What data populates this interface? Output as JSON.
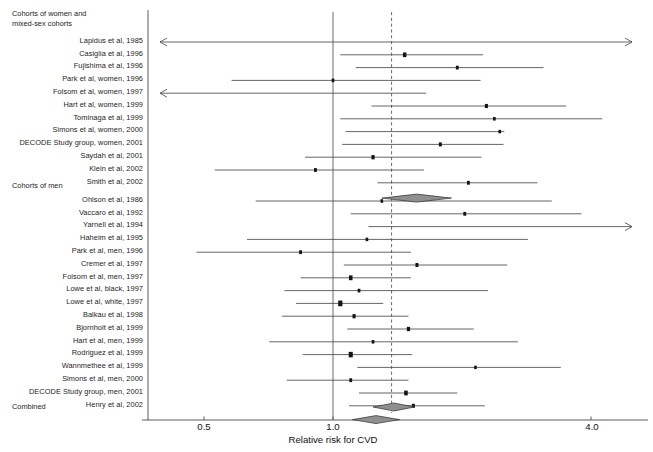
{
  "chart_data": {
    "type": "forest",
    "title": "",
    "xlabel": "Relative risk for CVD",
    "ylabel": "",
    "scale": "log",
    "xlim": [
      0.36,
      4.9
    ],
    "ticks": [
      {
        "value": 0.5,
        "label": "0.5"
      },
      {
        "value": 1.0,
        "label": "1.0"
      },
      {
        "value": 4.0,
        "label": "4.0"
      }
    ],
    "reference_line": {
      "value": 1.0,
      "style": "solid"
    },
    "pooled_line": {
      "value": 1.37,
      "style": "dashed"
    },
    "groups": [
      {
        "name": "Cohorts of women and mixed-sex cohorts",
        "heading_lines": [
          "Cohorts of women and",
          "mixed-sex cohorts"
        ],
        "studies": [
          {
            "label": "Lapidus et al, 1985",
            "rr": 1.37,
            "lo": 0.37,
            "hi": 4.9,
            "size": 0,
            "lo_clipped": true,
            "hi_clipped": true
          },
          {
            "label": "Casiglia et al, 1996",
            "rr": 1.47,
            "lo": 1.04,
            "hi": 2.24,
            "size": 3.3
          },
          {
            "label": "Fujishima et al, 1996",
            "rr": 1.95,
            "lo": 1.13,
            "hi": 3.1,
            "size": 1.9
          },
          {
            "label": "Park et al, women, 1996",
            "rr": 1.0,
            "lo": 0.58,
            "hi": 2.21,
            "size": 1.6
          },
          {
            "label": "Folsom et al, women, 1997",
            "rr": 1.37,
            "lo": 0.37,
            "hi": 1.65,
            "size": 0,
            "lo_clipped": true
          },
          {
            "label": "Hart et al, women, 1999",
            "rr": 2.28,
            "lo": 1.23,
            "hi": 3.5,
            "size": 2.4
          },
          {
            "label": "Tominaga et al, 1999",
            "rr": 2.38,
            "lo": 1.04,
            "hi": 4.25,
            "size": 1.5
          },
          {
            "label": "Simons et al, women, 2000",
            "rr": 2.45,
            "lo": 1.07,
            "hi": 2.51,
            "size": 1.5
          },
          {
            "label": "DECODE Study group, women, 2001",
            "rr": 1.78,
            "lo": 1.05,
            "hi": 2.5,
            "size": 2.2
          },
          {
            "label": "Saydah et al, 2001",
            "rr": 1.24,
            "lo": 0.86,
            "hi": 2.22,
            "size": 2.6
          },
          {
            "label": "Klein et al, 2002",
            "rr": 0.91,
            "lo": 0.53,
            "hi": 1.63,
            "size": 1.9
          },
          {
            "label": "Smith et al, 2002",
            "rr": 2.07,
            "lo": 1.27,
            "hi": 3.0,
            "size": 1.9
          }
        ],
        "subtotal": {
          "rr": 1.56,
          "lo": 1.3,
          "hi": 1.89
        }
      },
      {
        "name": "Cohorts of men",
        "heading_lines": [
          "Cohorts of men"
        ],
        "studies": [
          {
            "label": "Ohlson et al, 1986",
            "rr": 1.3,
            "lo": 0.66,
            "hi": 3.24,
            "size": 1.5
          },
          {
            "label": "Vaccaro et al, 1992",
            "rr": 2.03,
            "lo": 1.1,
            "hi": 3.8,
            "size": 1.9
          },
          {
            "label": "Yarnell et al, 1994",
            "rr": 2.58,
            "lo": 1.21,
            "hi": 4.9,
            "size": 0,
            "hi_clipped": true
          },
          {
            "label": "Haheim et al, 1995",
            "rr": 1.2,
            "lo": 0.63,
            "hi": 2.85,
            "size": 1.5
          },
          {
            "label": "Park et al, men, 1996",
            "rr": 0.84,
            "lo": 0.48,
            "hi": 1.52,
            "size": 1.9
          },
          {
            "label": "Cremer et al, 1997",
            "rr": 1.57,
            "lo": 1.06,
            "hi": 2.55,
            "size": 2.2
          },
          {
            "label": "Folsom et al, men, 1997",
            "rr": 1.1,
            "lo": 0.84,
            "hi": 1.52,
            "size": 3.6
          },
          {
            "label": "Lowe et al, black, 1997",
            "rr": 1.15,
            "lo": 0.77,
            "hi": 2.3,
            "size": 1.7
          },
          {
            "label": "Lowe et al, white, 1997",
            "rr": 1.04,
            "lo": 0.82,
            "hi": 1.31,
            "size": 5.6
          },
          {
            "label": "Balkau et al, 1998",
            "rr": 1.12,
            "lo": 0.76,
            "hi": 1.5,
            "size": 2.5
          },
          {
            "label": "Bjornholt et al, 1999",
            "rr": 1.5,
            "lo": 1.08,
            "hi": 2.13,
            "size": 2.7
          },
          {
            "label": "Hart et al, men, 1999",
            "rr": 1.24,
            "lo": 0.71,
            "hi": 2.7,
            "size": 1.5
          },
          {
            "label": "Rodriguez et al, 1999",
            "rr": 1.1,
            "lo": 0.85,
            "hi": 1.53,
            "size": 5.1
          },
          {
            "label": "Wannmethee et al, 1999",
            "rr": 2.15,
            "lo": 1.14,
            "hi": 3.4,
            "size": 1.4
          },
          {
            "label": "Simons et al, men, 2000",
            "rr": 1.1,
            "lo": 0.78,
            "hi": 1.5,
            "size": 1.9
          },
          {
            "label": "DECODE Study group, men, 2001",
            "rr": 1.48,
            "lo": 1.15,
            "hi": 1.95,
            "size": 3.6
          },
          {
            "label": "Henry et al, 2002",
            "rr": 1.54,
            "lo": 1.09,
            "hi": 2.26,
            "size": 2.2
          }
        ],
        "subtotal": {
          "rr": 1.28,
          "lo": 1.11,
          "hi": 1.43
        }
      },
      {
        "name": "Combined",
        "heading_lines": [
          "Combined"
        ],
        "studies": [],
        "subtotal": {
          "rr": 1.38,
          "lo": 1.24,
          "hi": 1.55
        }
      }
    ]
  },
  "axis": {
    "xlabel": "Relative risk for CVD",
    "tick_labels": [
      "0.5",
      "1.0",
      "4.0"
    ]
  },
  "headings": {
    "women_line1": "Cohorts of women and",
    "women_line2": "mixed-sex cohorts",
    "men": "Cohorts of men",
    "combined": "Combined"
  },
  "colors": {
    "marker": "#141414",
    "line": "#4a4a4a",
    "diamond_fill": "#8f8f8f",
    "diamond_stroke": "#2e2e2e",
    "dashed": "#6a6a6a",
    "background": "#ffffff"
  }
}
